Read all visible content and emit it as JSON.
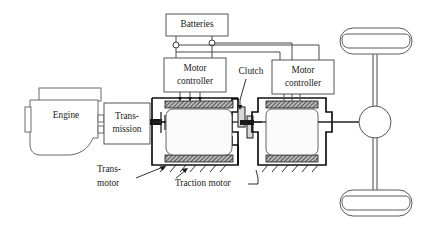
{
  "diagram": {
    "components": {
      "batteries": {
        "label": "Batteries",
        "name": "batteries-box"
      },
      "motor_controller_left": {
        "label_line1": "Motor",
        "label_line2": "controller",
        "name": "motor-controller-left"
      },
      "motor_controller_right": {
        "label_line1": "Motor",
        "label_line2": "controller",
        "name": "motor-controller-right"
      },
      "engine": {
        "label": "Engine",
        "name": "engine-block"
      },
      "transmission": {
        "label_line1": "Trans-",
        "label_line2": "mission",
        "name": "transmission-box"
      },
      "clutch": {
        "label": "Clutch",
        "name": "clutch-assembly"
      },
      "trans_motor": {
        "label_line1": "Trans-",
        "label_line2": "motor",
        "name": "trans-motor"
      },
      "traction_motor": {
        "label": "Traction motor",
        "name": "traction-motor"
      },
      "differential": {
        "name": "differential"
      },
      "wheel_top": {
        "name": "wheel-top"
      },
      "wheel_bottom": {
        "name": "wheel-bottom"
      }
    },
    "colors": {
      "line": "#4a4a4a",
      "heavy_line": "#111111",
      "box_fill": "#ffffff",
      "box_stroke": "#555555",
      "stator_fill": "#9a9a9a",
      "text": "#1a1a1a",
      "background": "#ffffff"
    },
    "connections": {
      "battery_terminal_count": 2,
      "controller_phase_wires": 3
    }
  }
}
